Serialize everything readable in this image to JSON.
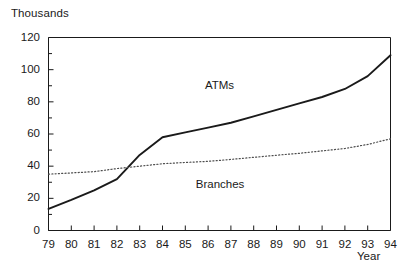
{
  "chart_data": {
    "type": "line",
    "title": "",
    "unit_label": "Thousands",
    "xlabel": "Year",
    "ylabel": "",
    "grid": false,
    "legend_position": "inline-annotations",
    "xlim": [
      79,
      94
    ],
    "ylim": [
      0,
      120
    ],
    "x": [
      79,
      80,
      81,
      82,
      83,
      84,
      85,
      86,
      87,
      88,
      89,
      90,
      91,
      92,
      93,
      94
    ],
    "xtick_labels": [
      "79",
      "80",
      "81",
      "82",
      "83",
      "84",
      "85",
      "86",
      "87",
      "88",
      "89",
      "90",
      "91",
      "92",
      "93",
      "94"
    ],
    "ytick_labels": [
      "0",
      "20",
      "40",
      "60",
      "80",
      "100",
      "120"
    ],
    "ytick_values": [
      0,
      20,
      40,
      60,
      80,
      100,
      120
    ],
    "yminor_values": [
      10,
      30,
      50,
      70,
      90,
      110
    ],
    "series": [
      {
        "name": "ATMs",
        "style": "solid",
        "color": "#1a1a1a",
        "label_x": 87,
        "label_y": 90,
        "values": [
          13.5,
          19,
          25,
          32,
          47,
          58,
          61,
          64,
          67,
          71,
          75,
          79,
          83,
          88,
          96,
          109
        ]
      },
      {
        "name": "Branches",
        "style": "dotted",
        "color": "#4d4d4d",
        "label_x": 86.6,
        "label_y": 28,
        "values": [
          35,
          35.8,
          36.6,
          38.5,
          40,
          41.5,
          42.3,
          43,
          44.2,
          45.5,
          46.8,
          48,
          49.5,
          51,
          53.5,
          57
        ]
      }
    ]
  }
}
